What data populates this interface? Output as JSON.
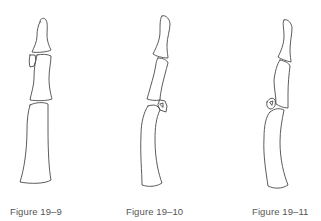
{
  "figures": [
    {
      "id": "fig-19-9",
      "caption": "Figure 19–9"
    },
    {
      "id": "fig-19-10",
      "caption": "Figure 19–10"
    },
    {
      "id": "fig-19-11",
      "caption": "Figure 19–11"
    }
  ],
  "colors": {
    "line": "#4a4a4a",
    "caption": "#555555",
    "background": "#ffffff"
  }
}
